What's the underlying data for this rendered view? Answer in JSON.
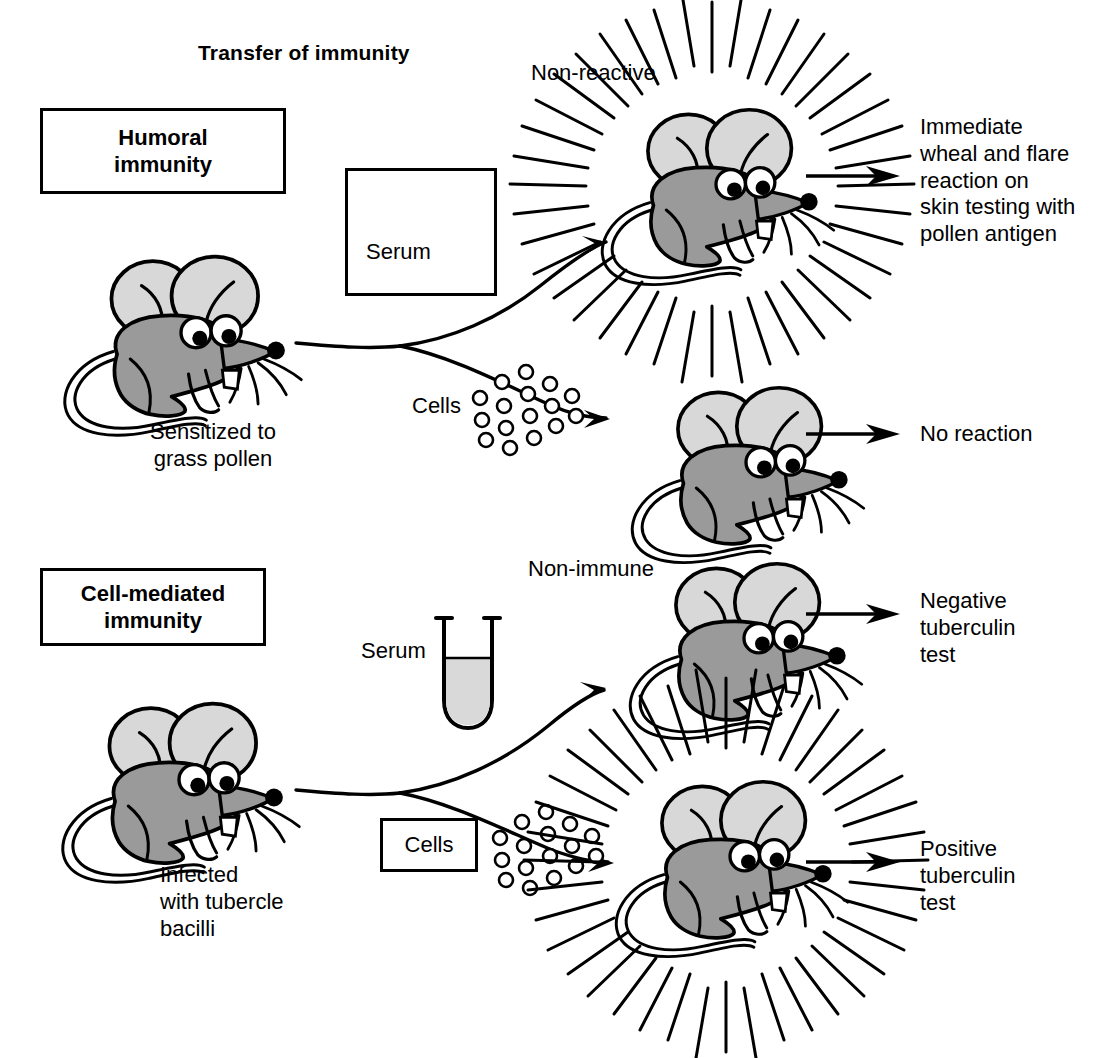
{
  "figure": {
    "title": "Transfer of immunity",
    "background_color": "#ffffff",
    "ink_color": "#000000",
    "mouse_body_color": "#9a9a9a",
    "mouse_ear_color": "#d8d8d8",
    "serum_fill_color": "#d9d9d9"
  },
  "panels": {
    "humoral": {
      "box_label": "Humoral\nimmunity",
      "source_mouse_caption": "Sensitized to\ngrass pollen",
      "transfer_serum": {
        "label": "Serum",
        "boxed": true
      },
      "transfer_cells": {
        "label": "Cells",
        "boxed": false
      },
      "recipient_top": {
        "state_label": "Non-reactive",
        "reacting": true,
        "outcome": "Immediate\nwheal and flare\nreaction on\nskin testing with\npollen antigen"
      },
      "recipient_bottom": {
        "state_label": "",
        "reacting": false,
        "outcome": "No reaction"
      }
    },
    "cell_mediated": {
      "box_label": "Cell-mediated\nimmunity",
      "source_mouse_caption": "Infected\nwith tubercle\nbacilli",
      "transfer_serum": {
        "label": "Serum",
        "boxed": false
      },
      "transfer_cells": {
        "label": "Cells",
        "boxed": true
      },
      "recipient_top": {
        "state_label": "Non-immune",
        "reacting": false,
        "outcome": "Negative\ntuberculin\ntest"
      },
      "recipient_bottom": {
        "state_label": "",
        "reacting": true,
        "outcome": "Positive\ntuberculin\ntest"
      }
    }
  }
}
